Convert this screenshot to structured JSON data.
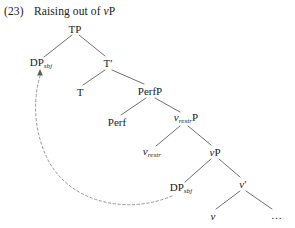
{
  "caption": {
    "number": "(23)",
    "text_before_italic": "Raising out of ",
    "italic_part": "v",
    "text_after_italic": "P",
    "full": "(23)  Raising out of vP"
  },
  "diagram": {
    "kind": "syntax-tree",
    "title": "Raising out of vP",
    "background_color": "#ffffff",
    "line_color": "#444444",
    "text_color": "#1a1a1a",
    "movement_arrow": {
      "style": "dashed",
      "from_node": "dp-sbj-lower",
      "to_node": "dp-sbj-upper",
      "arrowhead": "up"
    }
  },
  "nodes": [
    {
      "id": "tp",
      "label": "TP",
      "sub": "",
      "italic": false,
      "x": 75,
      "y": 29
    },
    {
      "id": "dp-sbj-up",
      "label": "DP",
      "sub": "sbj",
      "italic": false,
      "x": 40,
      "y": 64
    },
    {
      "id": "t-bar",
      "label": "T′",
      "sub": "",
      "italic": false,
      "x": 108,
      "y": 63
    },
    {
      "id": "t",
      "label": "T",
      "sub": "",
      "italic": false,
      "x": 80,
      "y": 92
    },
    {
      "id": "perfp",
      "label": "PerfP",
      "sub": "",
      "italic": false,
      "x": 150,
      "y": 91
    },
    {
      "id": "perf",
      "label": "Perf",
      "sub": "",
      "italic": false,
      "x": 117,
      "y": 122
    },
    {
      "id": "vrestrp",
      "label": "P",
      "sub": "restr",
      "italic": true,
      "x": 185,
      "y": 119
    },
    {
      "id": "vrestr",
      "label": "",
      "sub": "restr",
      "italic": true,
      "x": 151,
      "y": 153
    },
    {
      "id": "vp",
      "label": "P",
      "sub": "",
      "italic": true,
      "x": 215,
      "y": 152
    },
    {
      "id": "dp-sbj-low",
      "label": "DP",
      "sub": "sbj",
      "italic": false,
      "x": 180,
      "y": 189
    },
    {
      "id": "v-bar",
      "label": "′",
      "sub": "",
      "italic": true,
      "x": 243,
      "y": 184
    },
    {
      "id": "v",
      "label": "",
      "sub": "",
      "italic": true,
      "x": 213,
      "y": 216
    },
    {
      "id": "ellipsis",
      "label": "…",
      "sub": "",
      "italic": false,
      "x": 277,
      "y": 215
    }
  ],
  "labels": {
    "tp": "TP",
    "dp": "DP",
    "sbj": "sbj",
    "t_bar": "T′",
    "t": "T",
    "perfp": "PerfP",
    "perf": "Perf",
    "v": "v",
    "restr": "restr",
    "p": "P",
    "v_prime": "′",
    "ellipsis": "…"
  }
}
